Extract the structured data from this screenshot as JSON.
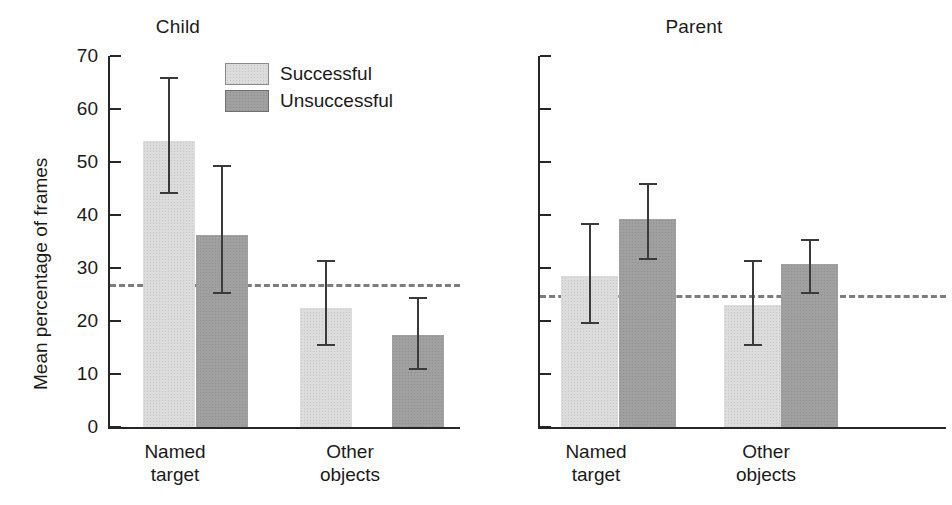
{
  "figure": {
    "y_axis_title": "Mean percentage of frames",
    "legend": [
      {
        "key": "successful",
        "label": "Successful",
        "color": "#dcdcdc"
      },
      {
        "key": "unsuccessful",
        "label": "Unsuccessful",
        "color": "#a0a0a0"
      }
    ]
  },
  "panels": [
    {
      "id": "child",
      "title": "Child"
    },
    {
      "id": "parent",
      "title": "Parent"
    }
  ],
  "ticks": [
    {
      "label": "0",
      "value": 0
    },
    {
      "label": "10",
      "value": 10
    },
    {
      "label": "20",
      "value": 20
    },
    {
      "label": "30",
      "value": 30
    },
    {
      "label": "40",
      "value": 40
    },
    {
      "label": "50",
      "value": 50
    },
    {
      "label": "60",
      "value": 60
    },
    {
      "label": "70",
      "value": 70
    }
  ],
  "categories": [
    {
      "line1": "Named",
      "line2": "target"
    },
    {
      "line1": "Other",
      "line2": "objects"
    }
  ],
  "chart_data": {
    "type": "bar",
    "title": "",
    "xlabel": "",
    "ylabel": "Mean percentage of frames",
    "ylim": [
      0,
      70
    ],
    "ytick_step": 10,
    "grid": false,
    "legend_position": "inside-top-left of Child panel",
    "error_bars": "yes",
    "panels": [
      {
        "name": "Child",
        "reference_line": 27,
        "categories": [
          "Named target",
          "Other objects"
        ],
        "series": [
          {
            "name": "Successful",
            "color": "#dcdcdc",
            "values": [
              54.0,
              22.5
            ],
            "err_low": [
              44.0,
              15.3
            ],
            "err_high": [
              66.0,
              31.5
            ]
          },
          {
            "name": "Unsuccessful",
            "color": "#a0a0a0",
            "values": [
              36.2,
              17.3
            ],
            "err_low": [
              25.0,
              10.7
            ],
            "err_high": [
              49.5,
              24.5
            ]
          }
        ]
      },
      {
        "name": "Parent",
        "reference_line": 25,
        "categories": [
          "Named target",
          "Other objects"
        ],
        "series": [
          {
            "name": "Successful",
            "color": "#dcdcdc",
            "values": [
              28.5,
              23.0
            ],
            "err_low": [
              19.5,
              15.3
            ],
            "err_high": [
              38.5,
              31.5
            ]
          },
          {
            "name": "Unsuccessful",
            "color": "#a0a0a0",
            "values": [
              39.3,
              30.8
            ],
            "err_low": [
              31.5,
              25.0
            ],
            "err_high": [
              46.0,
              35.5
            ]
          }
        ]
      }
    ]
  }
}
